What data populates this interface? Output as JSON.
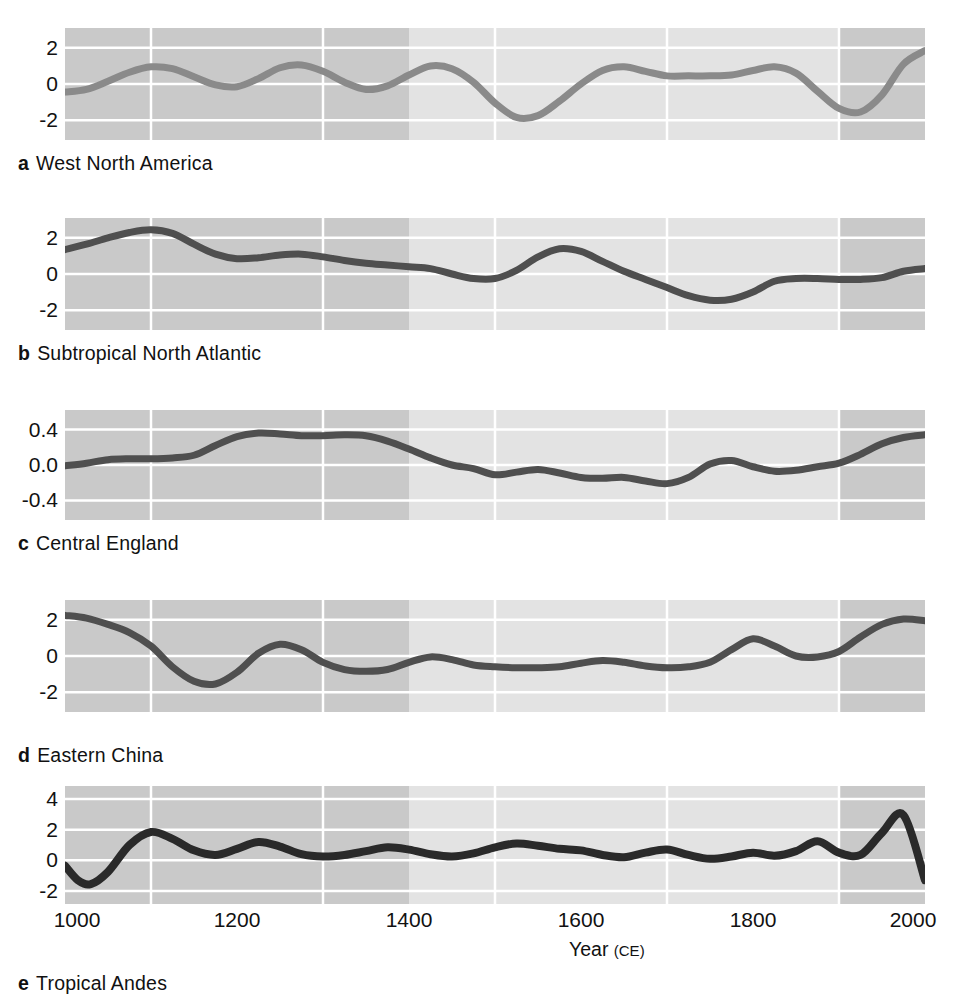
{
  "figure": {
    "xlabel_main": "Year",
    "xlabel_unit": "(CE)",
    "xticks": [
      "1000",
      "1200",
      "1400",
      "1600",
      "1800",
      "2000"
    ],
    "colors": {
      "band_dark": "#c9c9c9",
      "band_light": "#e3e3e3",
      "gridline": "#ffffff",
      "line_a": "#8a8a8a",
      "line_bcd": "#4f4f4f",
      "line_e": "#2a2a2a",
      "text": "#111111",
      "page_background": "#ffffff"
    }
  },
  "chart_data": {
    "type": "line",
    "title": "",
    "xlabel": "Year (CE)",
    "ylabel": "",
    "grid": true,
    "legend_position": "none",
    "xlim": [
      1000,
      2000
    ],
    "x_gridlines": [
      1100,
      1300,
      1500,
      1700,
      1900
    ],
    "x_tick_values": [
      1000,
      1200,
      1400,
      1600,
      1800,
      2000
    ],
    "shaded_highlight_span": [
      1400,
      1900
    ],
    "panels": [
      {
        "letter": "a",
        "label": "West North America",
        "ylabel": "",
        "yticks": [
          -2,
          0,
          2
        ],
        "ytick_labels": [
          "-2",
          "0",
          "2"
        ],
        "ylim": [
          -3.1,
          3.1
        ],
        "line_color": "#8a8a8a",
        "x": [
          1000,
          1025,
          1050,
          1075,
          1100,
          1125,
          1150,
          1175,
          1200,
          1225,
          1250,
          1275,
          1300,
          1325,
          1350,
          1375,
          1400,
          1425,
          1450,
          1475,
          1500,
          1525,
          1550,
          1575,
          1600,
          1625,
          1650,
          1675,
          1700,
          1725,
          1750,
          1775,
          1800,
          1825,
          1850,
          1875,
          1900,
          1925,
          1950,
          1975,
          2000
        ],
        "y": [
          -0.45,
          -0.3,
          0.15,
          0.65,
          0.95,
          0.85,
          0.4,
          -0.05,
          -0.15,
          0.3,
          0.9,
          1.05,
          0.7,
          0.1,
          -0.3,
          -0.1,
          0.5,
          1.0,
          0.85,
          0.1,
          -1.05,
          -1.85,
          -1.75,
          -0.95,
          0.0,
          0.75,
          0.95,
          0.7,
          0.45,
          0.45,
          0.45,
          0.5,
          0.75,
          0.95,
          0.6,
          -0.4,
          -1.35,
          -1.55,
          -0.6,
          1.1,
          1.85
        ]
      },
      {
        "letter": "b",
        "label": "Subtropical North Atlantic",
        "ylabel": "",
        "yticks": [
          -2,
          0,
          2
        ],
        "ytick_labels": [
          "-2",
          "0",
          "2"
        ],
        "ylim": [
          -3.1,
          3.1
        ],
        "line_color": "#4f4f4f",
        "x": [
          1000,
          1025,
          1050,
          1075,
          1100,
          1125,
          1150,
          1175,
          1200,
          1225,
          1250,
          1275,
          1300,
          1325,
          1350,
          1375,
          1400,
          1425,
          1450,
          1475,
          1500,
          1525,
          1550,
          1575,
          1600,
          1625,
          1650,
          1675,
          1700,
          1725,
          1750,
          1775,
          1800,
          1825,
          1850,
          1875,
          1900,
          1925,
          1950,
          1975,
          2000
        ],
        "y": [
          1.35,
          1.65,
          2.0,
          2.3,
          2.45,
          2.25,
          1.65,
          1.1,
          0.85,
          0.9,
          1.05,
          1.1,
          0.95,
          0.75,
          0.6,
          0.5,
          0.4,
          0.3,
          0.0,
          -0.25,
          -0.25,
          0.2,
          0.95,
          1.4,
          1.25,
          0.7,
          0.15,
          -0.3,
          -0.75,
          -1.2,
          -1.45,
          -1.4,
          -1.0,
          -0.4,
          -0.25,
          -0.25,
          -0.3,
          -0.3,
          -0.2,
          0.15,
          0.3
        ]
      },
      {
        "letter": "c",
        "label": "Central England",
        "ylabel": "",
        "yticks": [
          -0.4,
          0.0,
          0.4
        ],
        "ytick_labels": [
          "-0.4",
          "0.0",
          "0.4"
        ],
        "ylim": [
          -0.62,
          0.62
        ],
        "line_color": "#4f4f4f",
        "x": [
          1000,
          1025,
          1050,
          1075,
          1100,
          1125,
          1150,
          1175,
          1200,
          1225,
          1250,
          1275,
          1300,
          1325,
          1350,
          1375,
          1400,
          1425,
          1450,
          1475,
          1500,
          1525,
          1550,
          1575,
          1600,
          1625,
          1650,
          1675,
          1700,
          1725,
          1750,
          1775,
          1800,
          1825,
          1850,
          1875,
          1900,
          1925,
          1950,
          1975,
          2000
        ],
        "y": [
          -0.01,
          0.02,
          0.06,
          0.07,
          0.07,
          0.08,
          0.11,
          0.22,
          0.32,
          0.36,
          0.35,
          0.33,
          0.33,
          0.34,
          0.33,
          0.27,
          0.18,
          0.08,
          0.0,
          -0.04,
          -0.11,
          -0.08,
          -0.05,
          -0.09,
          -0.14,
          -0.15,
          -0.14,
          -0.18,
          -0.21,
          -0.14,
          0.01,
          0.05,
          -0.02,
          -0.07,
          -0.06,
          -0.02,
          0.02,
          0.12,
          0.24,
          0.31,
          0.34
        ]
      },
      {
        "letter": "d",
        "label": "Eastern China",
        "ylabel": "",
        "yticks": [
          -2,
          0,
          2
        ],
        "ytick_labels": [
          "-2",
          "0",
          "2"
        ],
        "ylim": [
          -3.1,
          3.1
        ],
        "line_color": "#4f4f4f",
        "x": [
          1000,
          1025,
          1050,
          1075,
          1100,
          1125,
          1150,
          1175,
          1200,
          1225,
          1250,
          1275,
          1300,
          1325,
          1350,
          1375,
          1400,
          1425,
          1450,
          1475,
          1500,
          1525,
          1550,
          1575,
          1600,
          1625,
          1650,
          1675,
          1700,
          1725,
          1750,
          1775,
          1800,
          1825,
          1850,
          1875,
          1900,
          1925,
          1950,
          1975,
          2000
        ],
        "y": [
          2.25,
          2.1,
          1.75,
          1.3,
          0.55,
          -0.6,
          -1.4,
          -1.55,
          -0.9,
          0.15,
          0.65,
          0.35,
          -0.35,
          -0.75,
          -0.85,
          -0.75,
          -0.35,
          -0.05,
          -0.2,
          -0.5,
          -0.6,
          -0.65,
          -0.65,
          -0.6,
          -0.4,
          -0.25,
          -0.35,
          -0.55,
          -0.65,
          -0.6,
          -0.35,
          0.35,
          0.95,
          0.55,
          0.0,
          -0.05,
          0.25,
          1.05,
          1.75,
          2.05,
          1.95
        ]
      },
      {
        "letter": "e",
        "label": "Tropical Andes",
        "ylabel": "",
        "yticks": [
          -2,
          0,
          2,
          4
        ],
        "ytick_labels": [
          "-2",
          "0",
          "2",
          "4"
        ],
        "ylim": [
          -2.85,
          4.85
        ],
        "line_color": "#2a2a2a",
        "x": [
          1000,
          1015,
          1030,
          1050,
          1075,
          1100,
          1125,
          1150,
          1175,
          1200,
          1225,
          1250,
          1275,
          1300,
          1325,
          1350,
          1375,
          1400,
          1425,
          1450,
          1475,
          1500,
          1525,
          1550,
          1575,
          1600,
          1625,
          1650,
          1675,
          1700,
          1725,
          1750,
          1775,
          1800,
          1825,
          1850,
          1875,
          1900,
          1925,
          1950,
          1975,
          2000
        ],
        "y": [
          -0.35,
          -1.3,
          -1.55,
          -0.75,
          1.0,
          1.85,
          1.4,
          0.65,
          0.35,
          0.75,
          1.2,
          0.9,
          0.4,
          0.25,
          0.35,
          0.6,
          0.85,
          0.7,
          0.4,
          0.25,
          0.45,
          0.85,
          1.1,
          0.95,
          0.75,
          0.65,
          0.35,
          0.2,
          0.5,
          0.7,
          0.35,
          0.1,
          0.25,
          0.5,
          0.3,
          0.6,
          1.25,
          0.5,
          0.35,
          1.8,
          2.95,
          -1.3
        ]
      }
    ]
  }
}
